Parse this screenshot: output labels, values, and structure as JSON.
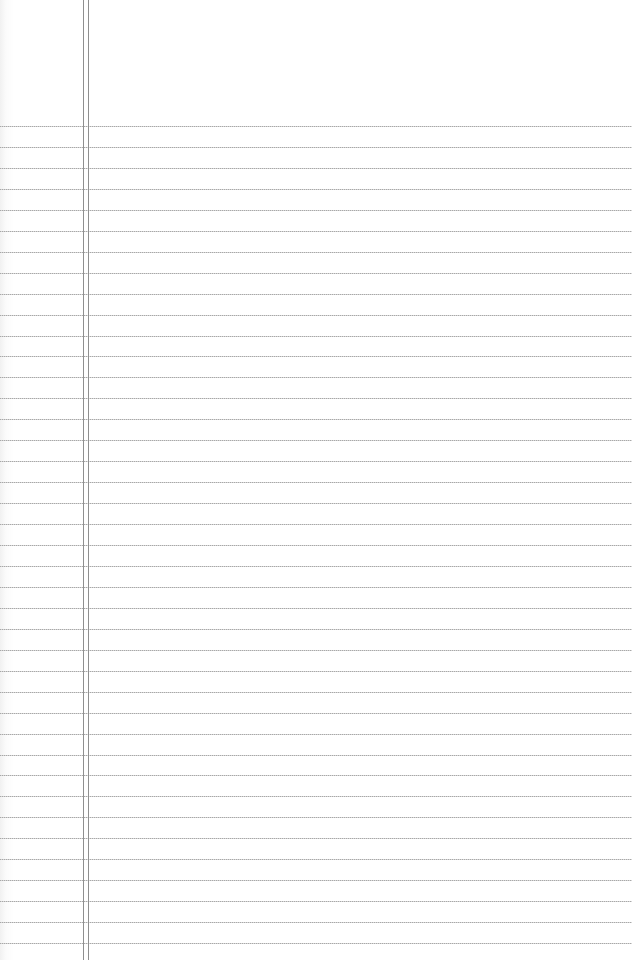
{
  "paper": {
    "type": "ruled-notepad",
    "background_color": "#ffffff",
    "rule_color": "#a8a8a8",
    "margin_line_color": "#8f8f8f",
    "first_rule_y": 126,
    "rule_spacing": 20.95,
    "rule_count": 40,
    "margin_lines_x": [
      83,
      88
    ]
  }
}
